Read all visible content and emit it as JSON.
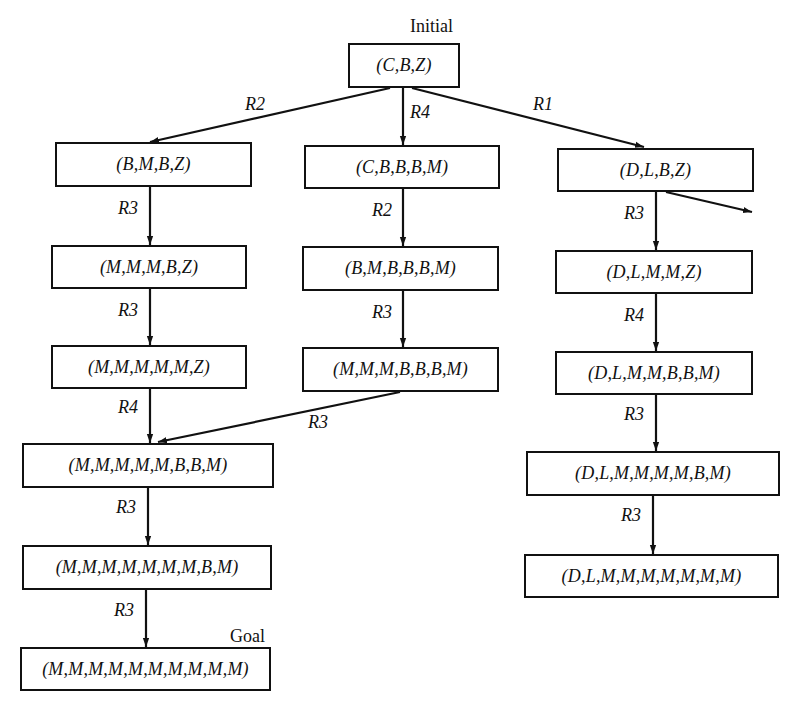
{
  "diagram": {
    "tags": {
      "initial": "Initial",
      "goal": "Goal"
    },
    "nodes": [
      {
        "id": "n0",
        "text": "(C,B,Z)",
        "x": 348,
        "y": 43,
        "w": 112,
        "h": 45
      },
      {
        "id": "n1",
        "text": "(B,M,B,Z)",
        "x": 55,
        "y": 142,
        "w": 197,
        "h": 45
      },
      {
        "id": "n2",
        "text": "(C,B,B,B,M)",
        "x": 304,
        "y": 145,
        "w": 196,
        "h": 44
      },
      {
        "id": "n3",
        "text": "(D,L,B,Z)",
        "x": 557,
        "y": 148,
        "w": 197,
        "h": 44
      },
      {
        "id": "n4",
        "text": "(M,M,M,B,Z)",
        "x": 51,
        "y": 245,
        "w": 196,
        "h": 44
      },
      {
        "id": "n5",
        "text": "(B,M,B,B,B,M)",
        "x": 302,
        "y": 246,
        "w": 197,
        "h": 45
      },
      {
        "id": "n6",
        "text": "(D,L,M,M,Z)",
        "x": 555,
        "y": 250,
        "w": 198,
        "h": 44
      },
      {
        "id": "n7",
        "text": "(M,M,M,M,M,Z)",
        "x": 51,
        "y": 345,
        "w": 196,
        "h": 44
      },
      {
        "id": "n8",
        "text": "(M,M,M,B,B,B,M)",
        "x": 302,
        "y": 347,
        "w": 197,
        "h": 45
      },
      {
        "id": "n9",
        "text": "(D,L,M,M,B,B,M)",
        "x": 555,
        "y": 351,
        "w": 198,
        "h": 44
      },
      {
        "id": "n10",
        "text": "(M,M,M,M,M,B,B,M)",
        "x": 22,
        "y": 443,
        "w": 252,
        "h": 45
      },
      {
        "id": "n11",
        "text": "(D,L,M,M,M,M,B,M)",
        "x": 526,
        "y": 451,
        "w": 254,
        "h": 45
      },
      {
        "id": "n12",
        "text": "(M,M,M,M,M,M,M,B,M)",
        "x": 22,
        "y": 545,
        "w": 250,
        "h": 45
      },
      {
        "id": "n13",
        "text": "(D,L,M,M,M,M,M,M,M)",
        "x": 524,
        "y": 554,
        "w": 255,
        "h": 44
      },
      {
        "id": "n14",
        "text": "(M,M,M,M,M,M,M,M,M,M)",
        "x": 20,
        "y": 647,
        "w": 251,
        "h": 44
      }
    ],
    "edges": [
      {
        "from": "n0",
        "to": "n1",
        "rule": "R2",
        "x1": 390,
        "y1": 88,
        "x2": 150,
        "y2": 142,
        "lx": 245,
        "ly": 94
      },
      {
        "from": "n0",
        "to": "n2",
        "rule": "R4",
        "x1": 403,
        "y1": 88,
        "x2": 403,
        "y2": 145,
        "lx": 410,
        "ly": 102
      },
      {
        "from": "n0",
        "to": "n3",
        "rule": "R1",
        "x1": 412,
        "y1": 88,
        "x2": 644,
        "y2": 147,
        "lx": 533,
        "ly": 94
      },
      {
        "from": "n3",
        "to": "out",
        "rule": "",
        "x1": 666,
        "y1": 192,
        "x2": 752,
        "y2": 212,
        "lx": 0,
        "ly": 0
      },
      {
        "from": "n1",
        "to": "n4",
        "rule": "R3",
        "x1": 150,
        "y1": 187,
        "x2": 150,
        "y2": 245,
        "lx": 118,
        "ly": 198
      },
      {
        "from": "n2",
        "to": "n5",
        "rule": "R2",
        "x1": 403,
        "y1": 189,
        "x2": 403,
        "y2": 246,
        "lx": 372,
        "ly": 200
      },
      {
        "from": "n3",
        "to": "n6",
        "rule": "R3",
        "x1": 656,
        "y1": 192,
        "x2": 656,
        "y2": 250,
        "lx": 624,
        "ly": 203
      },
      {
        "from": "n4",
        "to": "n7",
        "rule": "R3",
        "x1": 150,
        "y1": 289,
        "x2": 150,
        "y2": 345,
        "lx": 118,
        "ly": 300
      },
      {
        "from": "n5",
        "to": "n8",
        "rule": "R3",
        "x1": 403,
        "y1": 291,
        "x2": 403,
        "y2": 347,
        "lx": 372,
        "ly": 302
      },
      {
        "from": "n6",
        "to": "n9",
        "rule": "R4",
        "x1": 656,
        "y1": 294,
        "x2": 656,
        "y2": 351,
        "lx": 624,
        "ly": 305
      },
      {
        "from": "n7",
        "to": "n10",
        "rule": "R4",
        "x1": 150,
        "y1": 389,
        "x2": 150,
        "y2": 443,
        "lx": 118,
        "ly": 397
      },
      {
        "from": "n8",
        "to": "n10",
        "rule": "R3",
        "x1": 400,
        "y1": 392,
        "x2": 158,
        "y2": 442,
        "lx": 308,
        "ly": 412
      },
      {
        "from": "n9",
        "to": "n11",
        "rule": "R3",
        "x1": 656,
        "y1": 395,
        "x2": 656,
        "y2": 451,
        "lx": 624,
        "ly": 404
      },
      {
        "from": "n10",
        "to": "n12",
        "rule": "R3",
        "x1": 148,
        "y1": 488,
        "x2": 148,
        "y2": 545,
        "lx": 116,
        "ly": 497
      },
      {
        "from": "n11",
        "to": "n13",
        "rule": "R3",
        "x1": 653,
        "y1": 496,
        "x2": 653,
        "y2": 554,
        "lx": 621,
        "ly": 505
      },
      {
        "from": "n12",
        "to": "n14",
        "rule": "R3",
        "x1": 146,
        "y1": 590,
        "x2": 146,
        "y2": 647,
        "lx": 114,
        "ly": 600
      }
    ]
  }
}
